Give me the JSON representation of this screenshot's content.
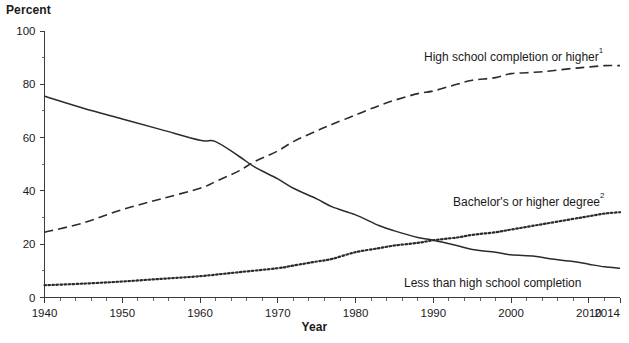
{
  "chart_data": {
    "type": "line",
    "title": "",
    "xlabel": "Year",
    "ylabel": "Percent",
    "xlim": [
      1940,
      2014
    ],
    "ylim": [
      0,
      100
    ],
    "grid": false,
    "legend_position": "inline-annotations",
    "x_ticks": [
      "1940",
      "1950",
      "1960",
      "1970",
      "1980",
      "1990",
      "2000",
      "2010",
      "2014"
    ],
    "x_tick_values": [
      1940,
      1950,
      1960,
      1970,
      1980,
      1990,
      2000,
      2010,
      2014
    ],
    "y_ticks": [
      "0",
      "20",
      "40",
      "60",
      "80",
      "100"
    ],
    "y_tick_values": [
      0,
      20,
      40,
      60,
      80,
      100
    ],
    "series": [
      {
        "name": "High school completion or higher",
        "footnote": "1",
        "style": "dashed",
        "x": [
          1940,
          1945,
          1950,
          1955,
          1960,
          1962,
          1965,
          1967,
          1970,
          1972,
          1975,
          1977,
          1980,
          1983,
          1985,
          1988,
          1990,
          1993,
          1995,
          1998,
          2000,
          2003,
          2005,
          2008,
          2010,
          2012,
          2014
        ],
        "values": [
          24.5,
          28.0,
          33.0,
          37.0,
          41.0,
          43.5,
          47.5,
          51.0,
          55.0,
          58.5,
          62.5,
          65.0,
          68.5,
          72.0,
          74.0,
          76.5,
          77.5,
          80.0,
          81.5,
          82.5,
          84.0,
          84.5,
          85.0,
          86.0,
          86.5,
          87.0,
          87.0
        ]
      },
      {
        "name": "Bachelor's or higher degree",
        "footnote": "2",
        "style": "dotted",
        "x": [
          1940,
          1945,
          1950,
          1955,
          1960,
          1965,
          1970,
          1972,
          1975,
          1977,
          1980,
          1983,
          1985,
          1988,
          1990,
          1993,
          1995,
          1998,
          2000,
          2003,
          2005,
          2008,
          2010,
          2012,
          2014
        ],
        "values": [
          4.6,
          5.2,
          6.0,
          7.0,
          8.0,
          9.5,
          11.0,
          12.0,
          13.5,
          14.5,
          17.0,
          18.5,
          19.5,
          20.5,
          21.5,
          22.5,
          23.5,
          24.5,
          25.5,
          27.0,
          28.0,
          29.5,
          30.5,
          31.5,
          32.0
        ]
      },
      {
        "name": "Less than high school completion",
        "footnote": "",
        "style": "solid",
        "x": [
          1940,
          1945,
          1950,
          1955,
          1960,
          1962,
          1965,
          1967,
          1970,
          1972,
          1975,
          1977,
          1980,
          1983,
          1985,
          1988,
          1990,
          1993,
          1995,
          1998,
          2000,
          2003,
          2005,
          2008,
          2010,
          2012,
          2014
        ],
        "values": [
          75.5,
          71.0,
          67.0,
          63.0,
          59.0,
          58.5,
          53.0,
          49.0,
          44.5,
          41.0,
          37.0,
          34.0,
          31.0,
          27.0,
          25.0,
          22.5,
          21.5,
          19.5,
          18.0,
          17.0,
          16.0,
          15.5,
          14.5,
          13.5,
          12.5,
          11.5,
          11.0
        ]
      }
    ],
    "annotations": [
      {
        "text": "High school completion or higher",
        "sup": "1",
        "x": 424,
        "y": 61
      },
      {
        "text": "Bachelor's or higher degree",
        "sup": "2",
        "x": 453,
        "y": 206
      },
      {
        "text": "Less than high school completion",
        "sup": "",
        "x": 404,
        "y": 287
      }
    ]
  }
}
